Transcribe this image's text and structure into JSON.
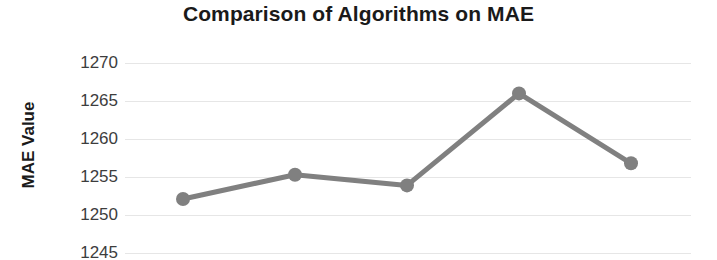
{
  "chart": {
    "title": "Comparison of Algorithms on MAE",
    "ylabel": "MAE Value",
    "yticks": [
      "1270",
      "1265",
      "1260",
      "1255",
      "1250",
      "1245"
    ],
    "series_color": "#808080",
    "grid_color": "#E6E6E6",
    "text_color": "#1A1A1A",
    "tick_color": "#3D3D3D"
  },
  "chart_data": {
    "type": "line",
    "title": "Comparison of Algorithms on MAE",
    "xlabel": "",
    "ylabel": "MAE Value",
    "categories": [
      "1",
      "2",
      "3",
      "4",
      "5"
    ],
    "x": [
      1,
      2,
      3,
      4,
      5
    ],
    "values": [
      1252.1,
      1255.3,
      1253.9,
      1266.0,
      1256.8
    ],
    "series": [
      {
        "name": "MAE",
        "color": "#808080",
        "values": [
          1252.1,
          1255.3,
          1253.9,
          1266.0,
          1256.8
        ]
      }
    ],
    "ylim": [
      1245,
      1270
    ],
    "ytick_values": [
      1270,
      1265,
      1260,
      1255,
      1250,
      1245
    ],
    "ytick_labels": [
      "1270",
      "1265",
      "1260",
      "1255",
      "1250",
      "1245"
    ],
    "xtick_labels": [],
    "grid": true,
    "grid_axis": "y",
    "legend": false,
    "legend_position": "none",
    "marker": "circle",
    "annotations": []
  }
}
